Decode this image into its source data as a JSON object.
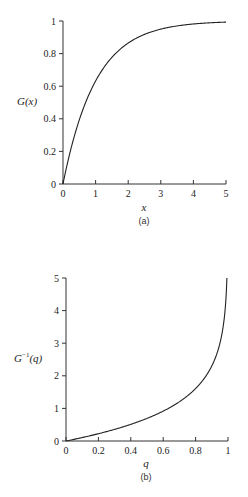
{
  "chart_data": [
    {
      "type": "line",
      "panel": "(a)",
      "title": "",
      "xlabel": "x",
      "ylabel": "G (x)",
      "xlim": [
        0,
        5
      ],
      "ylim": [
        0,
        1
      ],
      "xticks": [
        "0",
        "1",
        "2",
        "3",
        "4",
        "5"
      ],
      "yticks": [
        "0",
        "0.2",
        "0.4",
        "0.6",
        "0.8",
        "1"
      ],
      "grid": false,
      "legend": null,
      "series": [
        {
          "name": "G(x) = 1 - exp(-x)",
          "x": [
            0,
            0.25,
            0.5,
            0.75,
            1,
            1.5,
            2,
            2.5,
            3,
            3.5,
            4,
            4.5,
            5
          ],
          "y": [
            0,
            0.221,
            0.393,
            0.528,
            0.632,
            0.777,
            0.865,
            0.918,
            0.95,
            0.97,
            0.982,
            0.989,
            0.993
          ]
        }
      ]
    },
    {
      "type": "line",
      "panel": "(b)",
      "title": "",
      "xlabel": "q",
      "ylabel": "G⁻¹(q)",
      "xlim": [
        0,
        1
      ],
      "ylim": [
        0,
        5
      ],
      "xticks": [
        "0",
        "0.2",
        "0.4",
        "0.6",
        "0.8",
        "1"
      ],
      "yticks": [
        "0",
        "1",
        "2",
        "3",
        "4",
        "5"
      ],
      "grid": false,
      "legend": null,
      "series": [
        {
          "name": "G^-1(q) = -ln(1 - q)",
          "x": [
            0,
            0.1,
            0.2,
            0.3,
            0.4,
            0.5,
            0.6,
            0.7,
            0.8,
            0.85,
            0.9,
            0.95,
            0.98,
            0.993
          ],
          "y": [
            0,
            0.105,
            0.223,
            0.357,
            0.511,
            0.693,
            0.916,
            1.204,
            1.609,
            1.897,
            2.303,
            2.996,
            3.912,
            5.0
          ]
        }
      ]
    }
  ],
  "panel_a": {
    "caption": "(a)",
    "ylabel_main": "G",
    "ylabel_arg": "(x)",
    "xlabel": "x",
    "xticks": [
      "0",
      "1",
      "2",
      "3",
      "4",
      "5"
    ],
    "yticks": [
      "0",
      "0.2",
      "0.4",
      "0.6",
      "0.8",
      "1"
    ]
  },
  "panel_b": {
    "caption": "(b)",
    "ylabel_main": "G",
    "ylabel_sup": "−1",
    "ylabel_arg": "(q)",
    "xlabel": "q",
    "xticks": [
      "0",
      "0.2",
      "0.4",
      "0.6",
      "0.8",
      "1"
    ],
    "yticks": [
      "0",
      "1",
      "2",
      "3",
      "4",
      "5"
    ]
  }
}
